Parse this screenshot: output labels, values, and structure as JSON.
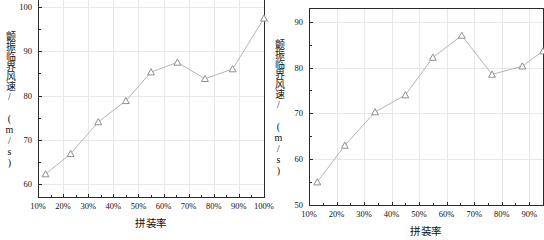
{
  "figure": {
    "width": 538,
    "height": 240,
    "background": "#ffffff",
    "line_color": "#b5b5b5",
    "marker_color": "#8f8f8f",
    "grid_color": "#e8e8e8",
    "axis_color": "#2b2b2b",
    "text_color": "#111111"
  },
  "charts": [
    {
      "id": "left",
      "type": "line",
      "title": "",
      "xlabel": "拼装率",
      "ylabel": "颤振临界风速/ (m/s)",
      "xtick_labels": [
        "10%",
        "20%",
        "30%",
        "40%",
        "50%",
        "60%",
        "70%",
        "80%",
        "90%",
        "100%"
      ],
      "xtick_values": [
        10,
        20,
        30,
        40,
        50,
        60,
        70,
        80,
        90,
        100
      ],
      "ytick_labels": [
        "60",
        "70",
        "80",
        "90",
        "100"
      ],
      "ytick_values": [
        60,
        70,
        80,
        90,
        100
      ],
      "xlim": [
        10,
        100
      ],
      "ylim": [
        57,
        103
      ],
      "grid": true,
      "marker": "triangle-open",
      "x": [
        13,
        23,
        34,
        45,
        55,
        65.5,
        76.5,
        87.5,
        100
      ],
      "values": [
        62.2,
        66.8,
        74.0,
        78.8,
        85.3,
        87.5,
        83.8,
        86.0,
        97.5
      ]
    },
    {
      "id": "right",
      "type": "line",
      "title": "",
      "xlabel": "拼装率",
      "ylabel": "颤振临界风速/ (m/s)",
      "xtick_labels": [
        "10%",
        "20%",
        "30%",
        "40%",
        "50%",
        "60%",
        "70%",
        "80%",
        "90%"
      ],
      "xtick_values": [
        10,
        20,
        30,
        40,
        50,
        60,
        70,
        80,
        90
      ],
      "ytick_labels": [
        "50",
        "60",
        "70",
        "80",
        "90"
      ],
      "ytick_values": [
        50,
        60,
        70,
        80,
        90
      ],
      "xlim": [
        10,
        95
      ],
      "ylim": [
        50,
        93
      ],
      "grid": true,
      "marker": "triangle-open",
      "x": [
        13,
        23,
        34,
        45,
        55,
        65.5,
        76.5,
        87.5,
        95
      ],
      "values": [
        55.0,
        63.0,
        70.3,
        74.0,
        82.2,
        87.0,
        78.5,
        80.3,
        83.6
      ]
    }
  ]
}
